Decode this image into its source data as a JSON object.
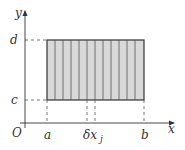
{
  "diagram": {
    "axes": {
      "x_label": "x",
      "y_label": "y",
      "origin_label": "O"
    },
    "x_ticks": [
      {
        "label": "a",
        "x": 47
      },
      {
        "label": "δx",
        "x": 87
      },
      {
        "label": "j",
        "x": 95
      },
      {
        "label": "b",
        "x": 144
      }
    ],
    "y_ticks": [
      {
        "label": "d",
        "y": 40
      },
      {
        "label": "c",
        "y": 100
      }
    ],
    "region": {
      "fill": "#d9d9d9",
      "stroke": "#333333",
      "strips": 12
    },
    "strip_label": "δx_j"
  }
}
